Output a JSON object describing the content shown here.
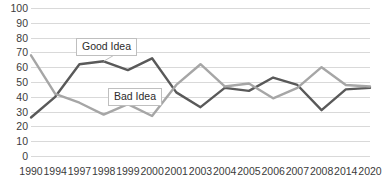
{
  "chart_data": {
    "type": "line",
    "title": "",
    "subtitle": "",
    "xlabel": "",
    "ylabel": "",
    "ylim": [
      0,
      100
    ],
    "ytick_step": 10,
    "yticks": [
      100,
      90,
      80,
      70,
      60,
      50,
      40,
      30,
      20,
      10,
      0
    ],
    "grid": true,
    "grid_axis": "y",
    "legend": "inline-callouts",
    "legend_position": "inline",
    "categories": [
      "1990",
      "1994",
      "1997",
      "1998",
      "1999",
      "2000",
      "2001",
      "2003",
      "2004",
      "2005",
      "2006",
      "2007",
      "2008",
      "2014",
      "2020"
    ],
    "series": [
      {
        "name": "Good Idea",
        "color": "#595959",
        "values": [
          26,
          40,
          62,
          64,
          58,
          66,
          43,
          33,
          46,
          44,
          53,
          48,
          31,
          45,
          46
        ]
      },
      {
        "name": "Bad Idea",
        "color": "#a6a6a6",
        "values": [
          68,
          42,
          36,
          28,
          35,
          27,
          48,
          62,
          47,
          49,
          39,
          46,
          60,
          48,
          47
        ]
      }
    ],
    "annotations": [
      {
        "id": "good-idea",
        "text": "Good Idea",
        "series": "Good Idea"
      },
      {
        "id": "bad-idea",
        "text": "Bad Idea",
        "series": "Bad Idea"
      }
    ]
  },
  "axes": {
    "y_labels": [
      "100",
      "90",
      "80",
      "70",
      "60",
      "50",
      "40",
      "30",
      "20",
      "10",
      "0"
    ],
    "x_labels": [
      "1990",
      "1994",
      "1997",
      "1998",
      "1999",
      "2000",
      "2001",
      "2003",
      "2004",
      "2005",
      "2006",
      "2007",
      "2008",
      "2014",
      "2020"
    ]
  },
  "callouts": {
    "good_idea": "Good Idea",
    "bad_idea": "Bad Idea"
  },
  "colors": {
    "series_good": "#595959",
    "series_bad": "#a6a6a6",
    "gridline": "#d9d9d9",
    "text": "#3b3b3b",
    "callout_border": "#bfbfbf",
    "background": "#ffffff"
  }
}
